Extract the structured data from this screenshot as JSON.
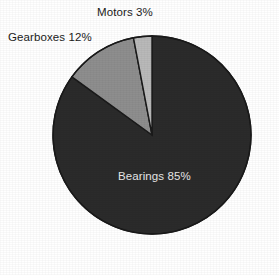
{
  "chart_data": {
    "type": "pie",
    "title": "",
    "subtitle": "",
    "xlabel": "",
    "ylabel": "",
    "legend_position": "none",
    "grid": false,
    "labels_shown": "category name and percentage",
    "categories": [
      "Bearings",
      "Gearboxes",
      "Motors"
    ],
    "values": [
      85,
      12,
      3
    ],
    "units": "%",
    "slices": [
      {
        "name": "Bearings",
        "value": 85,
        "label": "Bearings 85%",
        "color": "#2b2b2b",
        "label_color": "#e8e8e8",
        "label_placement": "inside"
      },
      {
        "name": "Gearboxes",
        "value": 12,
        "label": "Gearboxes 12%",
        "color": "#8e8e8e",
        "label_color": "#1b1b1b",
        "label_placement": "outside-left"
      },
      {
        "name": "Motors",
        "value": 3,
        "label": "Motors 3%",
        "color": "#b9b9b9",
        "label_color": "#1b1b1b",
        "label_placement": "outside-top"
      }
    ],
    "background_color": "#ffffff",
    "outline_color": "#1a1a1a",
    "start_angle_deg": 0,
    "direction": "clockwise"
  },
  "chart": {
    "motors_label": "Motors 3%",
    "gearboxes_label": "Gearboxes 12%",
    "bearings_label": "Bearings 85%"
  }
}
